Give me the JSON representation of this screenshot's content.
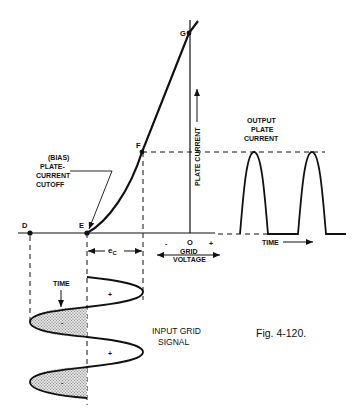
{
  "figure": {
    "caption": "Fig. 4-120.",
    "points": {
      "D": "D",
      "E": "E",
      "F": "F",
      "G": "G",
      "O": "O"
    },
    "labels": {
      "bias_line1": "(BIAS)",
      "bias_line2": "PLATE-",
      "bias_line3": "CURRENT",
      "bias_line4": "CUTOFF",
      "plate_current_axis": "PLATE  CURRENT",
      "grid_line1": "GRID",
      "grid_line2": "VOLTAGE",
      "minus": "-",
      "plus": "+",
      "ec": "e",
      "ec_sub": "C",
      "output_line1": "OUTPUT",
      "output_line2": "PLATE",
      "output_line3": "CURRENT",
      "time_output": "TIME",
      "time_input": "TIME",
      "input_line1": "INPUT GRID",
      "input_line2": "SIGNAL",
      "sig_plus_1": "+",
      "sig_plus_2": "+",
      "sig_minus_1": "-",
      "sig_minus_2": "-"
    },
    "colors": {
      "ink": "#111111",
      "stipple": "#bdbdbd",
      "background": "#ffffff"
    }
  }
}
